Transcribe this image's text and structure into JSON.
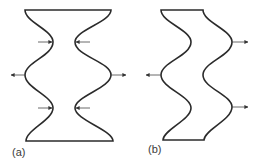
{
  "figure": {
    "panels": [
      {
        "id": "a",
        "label": "(a)",
        "description": "Symmetric shape with both sides bulging in at two points and out at the middle"
      },
      {
        "id": "b",
        "label": "(b)",
        "description": "Shape with both sides undulating in phase (serpentine)"
      }
    ],
    "colors": {
      "stroke": "#2b2b2b",
      "arrow": "#444444",
      "background": "#ffffff"
    }
  }
}
